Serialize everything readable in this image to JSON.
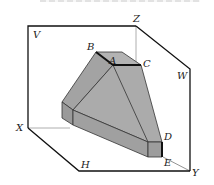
{
  "figure": {
    "type": "3D projection diagram (three-plane projection box with solid)",
    "planes": {
      "vertical": "V",
      "horizontal": "H",
      "side": "W"
    },
    "axes": {
      "x": "X",
      "y": "Y",
      "z": "Z"
    },
    "points": {
      "A": "A",
      "B": "B",
      "C": "C",
      "D": "D",
      "E": "E"
    },
    "colors": {
      "solid_fill": "#a9a9a9",
      "solid_top": "#b5b5b5",
      "solid_side": "#9c9c9c",
      "edge": "#222222",
      "frame": "#111111",
      "hidden_axis": "#999999"
    }
  }
}
